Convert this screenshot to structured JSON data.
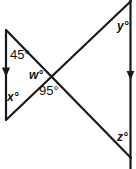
{
  "figure": {
    "stroke_color": "#1a1a1a",
    "background_color": "#ffffff",
    "label_color": "#111111",
    "labels": [
      {
        "id": "angle-45",
        "text": "45°",
        "kind": "known",
        "value": 45,
        "unit": "degrees"
      },
      {
        "id": "angle-x",
        "text": "x°",
        "kind": "unknown",
        "variable": "x"
      },
      {
        "id": "angle-w",
        "text": "w°",
        "kind": "unknown",
        "variable": "w"
      },
      {
        "id": "angle-95",
        "text": "95°",
        "kind": "known",
        "value": 95,
        "unit": "degrees"
      },
      {
        "id": "angle-y",
        "text": "y°",
        "kind": "unknown",
        "variable": "y"
      },
      {
        "id": "angle-z",
        "text": "z°",
        "kind": "unknown",
        "variable": "z"
      }
    ],
    "geometry": {
      "left_parallel_line": {
        "x": 6,
        "y_start": 30,
        "y_end": 120,
        "arrow": "down",
        "arrow_at_y": 72
      },
      "right_parallel_line": {
        "x": 130,
        "y_start": 0,
        "y_end": 169,
        "arrow": "down",
        "arrow_at_y": 75
      },
      "transversal_down_right": {
        "x1": 6,
        "y1": 30,
        "x2": 131,
        "y2": 158
      },
      "transversal_up_right": {
        "x1": 6,
        "y1": 120,
        "x2": 131,
        "y2": 1
      },
      "intersection": {
        "x": 52,
        "y": 76
      }
    }
  }
}
